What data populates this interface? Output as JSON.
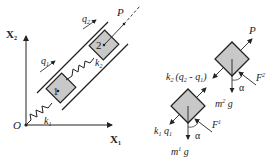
{
  "diagram": {
    "type": "two-mass spring system on inclined guide with free-body diagrams",
    "left_panel": {
      "axes": {
        "x_label": "X",
        "x_sub": "1",
        "y_label": "X",
        "y_sub": "2",
        "origin_label": "O"
      },
      "springs": [
        {
          "label": "k",
          "sub": "1"
        },
        {
          "label": "k",
          "sub": "2"
        }
      ],
      "masses": [
        {
          "label": "1"
        },
        {
          "label": "2"
        }
      ],
      "coordinates": [
        {
          "label": "q",
          "sub": "1"
        },
        {
          "label": "q",
          "sub": "2"
        }
      ],
      "force": {
        "label": "P"
      }
    },
    "right_panel": {
      "body2": {
        "forces": [
          "P",
          "k2 (q2 - q1)",
          "m2 g",
          "F_r^2"
        ],
        "force_P": "P",
        "spring_force": {
          "k": "k",
          "k_sub": "2",
          "text": "(q",
          "q2_sub": "2",
          "minus": " - q",
          "q1_sub": "1",
          "close": ")"
        },
        "weight": {
          "m": "m",
          "sup": "2",
          "g": " g"
        },
        "friction": {
          "F": "F",
          "sub": "r",
          "sup": "2"
        },
        "angle": "α"
      },
      "body1": {
        "spring_force": {
          "k": "k",
          "k_sub": "1",
          "q": " q",
          "q_sub": "1"
        },
        "weight": {
          "m": "m",
          "sup": "1",
          "g": " g"
        },
        "friction": {
          "F": "F",
          "sub": "r",
          "sup": "1"
        },
        "angle": "α"
      }
    },
    "colors": {
      "line": "#222222",
      "block_fill": "#c8c8c8"
    }
  }
}
